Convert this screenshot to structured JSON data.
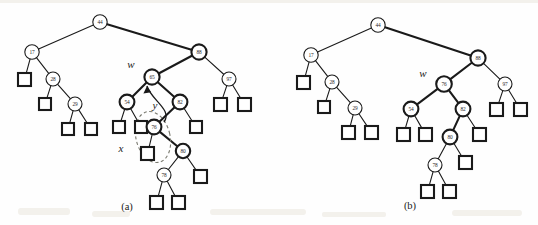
{
  "figure": {
    "background_color": "#fefefe",
    "ink_color": "#1a1a1a",
    "dashed_color": "#7a7a70",
    "panels": [
      {
        "id": "a",
        "caption": "(a)",
        "caption_pos": {
          "x": 127,
          "y": 206
        },
        "pointer_labels": [
          {
            "name": "w",
            "text": "w",
            "x": 131,
            "y": 64
          },
          {
            "name": "y",
            "text": "y",
            "x": 155,
            "y": 105
          },
          {
            "name": "x",
            "text": "x",
            "x": 121,
            "y": 148
          }
        ],
        "nodes": [
          {
            "key": "44",
            "x": 100,
            "y": 22,
            "r": 7.2,
            "weight": "thin"
          },
          {
            "key": "17",
            "x": 32,
            "y": 52,
            "r": 7.2,
            "weight": "thin"
          },
          {
            "key": "88",
            "x": 199,
            "y": 52,
            "r": 7.6,
            "weight": "thick"
          },
          {
            "key": "28",
            "x": 53,
            "y": 79,
            "r": 7.0,
            "weight": "thin"
          },
          {
            "key": "65",
            "x": 152,
            "y": 77,
            "r": 7.6,
            "weight": "thick"
          },
          {
            "key": "97",
            "x": 229,
            "y": 79,
            "r": 7.0,
            "weight": "thin"
          },
          {
            "key": "29",
            "x": 75,
            "y": 104,
            "r": 7.0,
            "weight": "thin"
          },
          {
            "key": "54",
            "x": 127,
            "y": 102,
            "r": 7.4,
            "weight": "thick"
          },
          {
            "key": "82",
            "x": 180,
            "y": 102,
            "r": 7.4,
            "weight": "thick"
          },
          {
            "key": "76",
            "x": 154,
            "y": 127,
            "r": 7.4,
            "weight": "thick"
          },
          {
            "key": "80",
            "x": 183,
            "y": 151,
            "r": 7.2,
            "weight": "thick"
          },
          {
            "key": "78",
            "x": 164,
            "y": 175,
            "r": 7.0,
            "weight": "thin"
          }
        ],
        "leaves": [
          {
            "name": "leaf-17-left",
            "x": 18,
            "y": 73,
            "w": 13,
            "h": 13,
            "weight": "thick"
          },
          {
            "name": "leaf-28-left",
            "x": 39,
            "y": 98,
            "w": 12,
            "h": 12,
            "weight": "thick"
          },
          {
            "name": "leaf-29-left",
            "x": 62,
            "y": 123,
            "w": 12,
            "h": 12,
            "weight": "thick"
          },
          {
            "name": "leaf-29-right",
            "x": 85,
            "y": 123,
            "w": 12,
            "h": 12,
            "weight": "thick"
          },
          {
            "name": "leaf-54-left",
            "x": 113,
            "y": 121,
            "w": 12,
            "h": 12,
            "weight": "thick"
          },
          {
            "name": "leaf-54-right",
            "x": 135,
            "y": 121,
            "w": 12,
            "h": 12,
            "weight": "thick"
          },
          {
            "name": "leaf-76-left",
            "x": 141,
            "y": 147,
            "w": 13,
            "h": 13,
            "weight": "thick"
          },
          {
            "name": "leaf-82-right",
            "x": 190,
            "y": 121,
            "w": 12,
            "h": 12,
            "weight": "thick"
          },
          {
            "name": "leaf-97-left",
            "x": 214,
            "y": 98,
            "w": 13,
            "h": 13,
            "weight": "thick"
          },
          {
            "name": "leaf-97-right",
            "x": 238,
            "y": 98,
            "w": 13,
            "h": 13,
            "weight": "thick"
          },
          {
            "name": "leaf-80-right",
            "x": 194,
            "y": 170,
            "w": 13,
            "h": 13,
            "weight": "thick"
          },
          {
            "name": "leaf-78-left",
            "x": 150,
            "y": 196,
            "w": 13,
            "h": 13,
            "weight": "thick"
          },
          {
            "name": "leaf-78-right",
            "x": 172,
            "y": 196,
            "w": 13,
            "h": 13,
            "weight": "thick"
          }
        ],
        "edges": [
          {
            "from": "44",
            "to": "17",
            "weight": "thin"
          },
          {
            "from": "44",
            "to": "88",
            "weight": "thick"
          },
          {
            "from": "17",
            "to": "leaf-17-left",
            "weight": "thin"
          },
          {
            "from": "17",
            "to": "28",
            "weight": "thin"
          },
          {
            "from": "28",
            "to": "leaf-28-left",
            "weight": "thin"
          },
          {
            "from": "28",
            "to": "29",
            "weight": "thin"
          },
          {
            "from": "29",
            "to": "leaf-29-left",
            "weight": "thin"
          },
          {
            "from": "29",
            "to": "leaf-29-right",
            "weight": "thin"
          },
          {
            "from": "88",
            "to": "65",
            "weight": "thick"
          },
          {
            "from": "88",
            "to": "97",
            "weight": "thin"
          },
          {
            "from": "97",
            "to": "leaf-97-left",
            "weight": "thin"
          },
          {
            "from": "97",
            "to": "leaf-97-right",
            "weight": "thin"
          },
          {
            "from": "65",
            "to": "54",
            "weight": "thick"
          },
          {
            "from": "65",
            "to": "82",
            "weight": "thick"
          },
          {
            "from": "54",
            "to": "leaf-54-left",
            "weight": "thin"
          },
          {
            "from": "54",
            "to": "leaf-54-right",
            "weight": "thin"
          },
          {
            "from": "82",
            "to": "76",
            "weight": "thick"
          },
          {
            "from": "82",
            "to": "leaf-82-right",
            "weight": "thin"
          },
          {
            "from": "76",
            "to": "leaf-76-left",
            "weight": "thin"
          },
          {
            "from": "76",
            "to": "80",
            "weight": "thick"
          },
          {
            "from": "80",
            "to": "78",
            "weight": "thin"
          },
          {
            "from": "80",
            "to": "leaf-80-right",
            "weight": "thin"
          },
          {
            "from": "78",
            "to": "leaf-78-left",
            "weight": "thin"
          },
          {
            "from": "78",
            "to": "leaf-78-right",
            "weight": "thin"
          }
        ],
        "annotation": {
          "dashed_ellipse": {
            "cx": 153,
            "cy": 137,
            "rx": 17,
            "ry": 26,
            "rotate": -14
          },
          "restructure_arrow": {
            "from_x": 164,
            "from_y": 122,
            "to_x": 147,
            "to_y": 86
          }
        }
      },
      {
        "id": "b",
        "caption": "(b)",
        "caption_pos": {
          "x": 410,
          "y": 205
        },
        "pointer_labels": [
          {
            "name": "w",
            "text": "w",
            "x": 423,
            "y": 73
          }
        ],
        "nodes": [
          {
            "key": "44",
            "x": 378,
            "y": 25,
            "r": 7.2,
            "weight": "thin"
          },
          {
            "key": "17",
            "x": 311,
            "y": 55,
            "r": 7.2,
            "weight": "thin"
          },
          {
            "key": "88",
            "x": 478,
            "y": 58,
            "r": 7.6,
            "weight": "thick"
          },
          {
            "key": "28",
            "x": 332,
            "y": 82,
            "r": 7.0,
            "weight": "thin"
          },
          {
            "key": "76",
            "x": 444,
            "y": 84,
            "r": 7.8,
            "weight": "thick"
          },
          {
            "key": "97",
            "x": 505,
            "y": 84,
            "r": 7.0,
            "weight": "thin"
          },
          {
            "key": "29",
            "x": 355,
            "y": 108,
            "r": 7.0,
            "weight": "thin"
          },
          {
            "key": "54",
            "x": 411,
            "y": 109,
            "r": 7.4,
            "weight": "thick"
          },
          {
            "key": "82",
            "x": 463,
            "y": 109,
            "r": 7.4,
            "weight": "thick"
          },
          {
            "key": "80",
            "x": 450,
            "y": 137,
            "r": 7.4,
            "weight": "thick"
          },
          {
            "key": "78",
            "x": 435,
            "y": 165,
            "r": 7.0,
            "weight": "thin"
          }
        ],
        "leaves": [
          {
            "name": "leaf-17-left",
            "x": 297,
            "y": 76,
            "w": 13,
            "h": 13,
            "weight": "thick"
          },
          {
            "name": "leaf-28-left",
            "x": 318,
            "y": 101,
            "w": 12,
            "h": 12,
            "weight": "thick"
          },
          {
            "name": "leaf-29-left",
            "x": 342,
            "y": 126,
            "w": 13,
            "h": 13,
            "weight": "thick"
          },
          {
            "name": "leaf-29-right",
            "x": 365,
            "y": 126,
            "w": 13,
            "h": 13,
            "weight": "thick"
          },
          {
            "name": "leaf-54-left",
            "x": 397,
            "y": 128,
            "w": 13,
            "h": 13,
            "weight": "thick"
          },
          {
            "name": "leaf-54-right",
            "x": 419,
            "y": 128,
            "w": 13,
            "h": 13,
            "weight": "thick"
          },
          {
            "name": "leaf-82-right",
            "x": 473,
            "y": 128,
            "w": 13,
            "h": 13,
            "weight": "thick"
          },
          {
            "name": "leaf-80-right",
            "x": 459,
            "y": 156,
            "w": 13,
            "h": 13,
            "weight": "thick"
          },
          {
            "name": "leaf-97-left",
            "x": 490,
            "y": 103,
            "w": 13,
            "h": 13,
            "weight": "thick"
          },
          {
            "name": "leaf-97-right",
            "x": 514,
            "y": 103,
            "w": 13,
            "h": 13,
            "weight": "thick"
          },
          {
            "name": "leaf-78-left",
            "x": 421,
            "y": 185,
            "w": 13,
            "h": 13,
            "weight": "thick"
          },
          {
            "name": "leaf-78-right",
            "x": 443,
            "y": 185,
            "w": 13,
            "h": 13,
            "weight": "thick"
          }
        ],
        "edges": [
          {
            "from": "44",
            "to": "17",
            "weight": "thin"
          },
          {
            "from": "44",
            "to": "88",
            "weight": "thick"
          },
          {
            "from": "17",
            "to": "leaf-17-left",
            "weight": "thin"
          },
          {
            "from": "17",
            "to": "28",
            "weight": "thin"
          },
          {
            "from": "28",
            "to": "leaf-28-left",
            "weight": "thin"
          },
          {
            "from": "28",
            "to": "29",
            "weight": "thin"
          },
          {
            "from": "29",
            "to": "leaf-29-left",
            "weight": "thin"
          },
          {
            "from": "29",
            "to": "leaf-29-right",
            "weight": "thin"
          },
          {
            "from": "88",
            "to": "76",
            "weight": "thick"
          },
          {
            "from": "88",
            "to": "97",
            "weight": "thin"
          },
          {
            "from": "97",
            "to": "leaf-97-left",
            "weight": "thin"
          },
          {
            "from": "97",
            "to": "leaf-97-right",
            "weight": "thin"
          },
          {
            "from": "76",
            "to": "54",
            "weight": "thick"
          },
          {
            "from": "76",
            "to": "82",
            "weight": "thick"
          },
          {
            "from": "54",
            "to": "leaf-54-left",
            "weight": "thin"
          },
          {
            "from": "54",
            "to": "leaf-54-right",
            "weight": "thin"
          },
          {
            "from": "82",
            "to": "80",
            "weight": "thick"
          },
          {
            "from": "82",
            "to": "leaf-82-right",
            "weight": "thin"
          },
          {
            "from": "80",
            "to": "78",
            "weight": "thin"
          },
          {
            "from": "80",
            "to": "leaf-80-right",
            "weight": "thin"
          },
          {
            "from": "78",
            "to": "leaf-78-left",
            "weight": "thin"
          },
          {
            "from": "78",
            "to": "leaf-78-right",
            "weight": "thin"
          }
        ],
        "annotation": null
      }
    ]
  }
}
